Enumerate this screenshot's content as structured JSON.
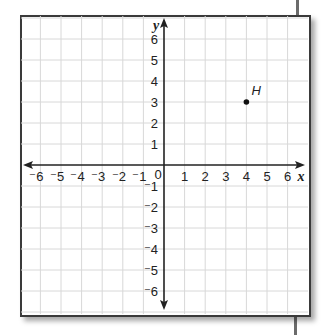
{
  "graph": {
    "x_axis_label": "x",
    "y_axis_label": "y",
    "origin_label": "0",
    "x_tick_labels": [
      "⁻6",
      "⁻5",
      "⁻4",
      "⁻3",
      "⁻2",
      "⁻1",
      "1",
      "2",
      "3",
      "4",
      "5",
      "6"
    ],
    "y_tick_labels_positive": [
      "1",
      "2",
      "3",
      "4",
      "5",
      "6"
    ],
    "y_tick_labels_negative": [
      "⁻1",
      "⁻2",
      "⁻3",
      "⁻4",
      "⁻5",
      "⁻6"
    ],
    "points": [
      {
        "label": "H",
        "x": 4,
        "y": 3
      }
    ],
    "colors": {
      "grid": "#d8d8d8",
      "axis": "#222222",
      "frame": "#3a3a3a"
    }
  },
  "chart_data": {
    "type": "scatter",
    "title": "",
    "xlabel": "x",
    "ylabel": "y",
    "xlim": [
      -6,
      6
    ],
    "ylim": [
      -6,
      6
    ],
    "grid": true,
    "series": [
      {
        "name": "H",
        "points": [
          {
            "x": 4,
            "y": 3,
            "label": "H"
          }
        ]
      }
    ]
  }
}
